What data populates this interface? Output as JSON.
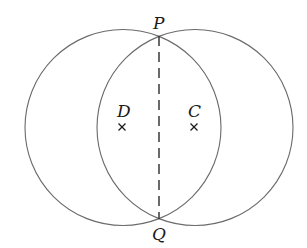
{
  "diagram": {
    "type": "two intersecting circles with common chord",
    "circles": [
      {
        "name": "circle-D",
        "center_label": "D",
        "cx": 123,
        "cy": 127.5,
        "r": 98
      },
      {
        "name": "circle-C",
        "center_label": "C",
        "cx": 195,
        "cy": 127.5,
        "r": 98
      }
    ],
    "points": {
      "P": {
        "label": "P",
        "x": 159,
        "y": 36
      },
      "Q": {
        "label": "Q",
        "x": 159,
        "y": 219
      },
      "D": {
        "label": "D",
        "x": 122,
        "y": 127
      },
      "C": {
        "label": "C",
        "x": 194,
        "y": 127
      }
    },
    "chord": {
      "from": "P",
      "to": "Q",
      "style": "dashed"
    },
    "center_marker": "×",
    "colors": {
      "circle_stroke": "#6a6a6a",
      "chord_stroke": "#2a2a2a",
      "text": "#1a1a1a",
      "background": "#ffffff"
    }
  }
}
